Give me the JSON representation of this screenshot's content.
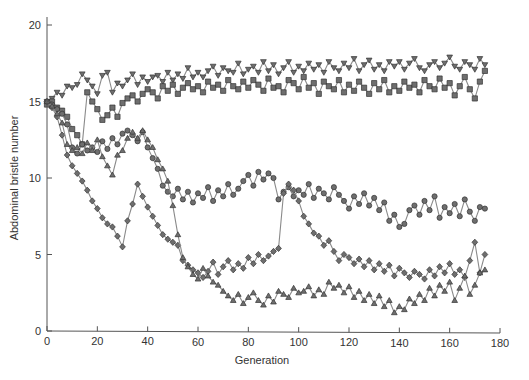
{
  "chart_data": {
    "type": "line",
    "title": "",
    "xlabel": "Generation",
    "ylabel": "Abdominal bristle number",
    "xlim": [
      0,
      180
    ],
    "ylim": [
      0,
      20
    ],
    "xticks": [
      0,
      20,
      40,
      60,
      80,
      100,
      120,
      140,
      160,
      180
    ],
    "yticks": [
      0,
      5,
      10,
      15,
      20
    ],
    "grid": false,
    "legend": null,
    "colors": {
      "line": "#8a8a8a",
      "marker_fill": "#6e6e6e",
      "marker_stroke": "#333333",
      "axis": "#555555"
    },
    "series": [
      {
        "name": "Upward line 1",
        "marker": "triangle-down",
        "x_start": 0,
        "x_step": 2,
        "values": [
          15.0,
          15.2,
          15.6,
          15.4,
          16.0,
          15.9,
          16.1,
          16.8,
          16.4,
          16.0,
          15.5,
          16.7,
          16.9,
          15.6,
          16.2,
          16.0,
          16.4,
          16.8,
          16.1,
          16.6,
          16.3,
          16.6,
          16.7,
          16.3,
          16.9,
          16.4,
          16.8,
          16.5,
          17.2,
          16.6,
          16.9,
          16.6,
          17.0,
          17.3,
          16.7,
          17.2,
          17.0,
          16.9,
          17.5,
          16.8,
          17.1,
          17.3,
          16.9,
          17.6,
          17.0,
          17.4,
          16.8,
          17.2,
          17.6,
          16.9,
          17.3,
          17.0,
          17.5,
          17.1,
          17.4,
          16.9,
          17.6,
          17.2,
          17.0,
          17.5,
          17.2,
          17.8,
          17.0,
          17.4,
          17.7,
          17.1,
          17.4,
          17.0,
          17.6,
          17.3,
          17.6,
          17.1,
          17.5,
          17.8,
          17.2,
          17.0,
          17.4,
          17.6,
          17.2,
          17.5,
          17.9,
          17.3,
          17.1,
          17.6,
          17.4,
          17.1,
          17.8,
          17.4
        ]
      },
      {
        "name": "Upward line 2",
        "marker": "square",
        "x_start": 0,
        "x_step": 2,
        "values": [
          14.8,
          15.0,
          14.6,
          14.4,
          14.0,
          13.2,
          12.8,
          12.2,
          15.6,
          15.0,
          14.5,
          13.8,
          14.1,
          14.6,
          14.0,
          14.9,
          15.2,
          15.4,
          15.0,
          15.5,
          15.8,
          15.6,
          15.2,
          16.0,
          15.7,
          16.1,
          15.5,
          15.9,
          16.2,
          15.8,
          16.0,
          15.6,
          16.3,
          15.9,
          16.1,
          15.7,
          16.4,
          16.0,
          15.8,
          16.3,
          15.9,
          16.4,
          16.1,
          15.7,
          16.5,
          15.9,
          16.0,
          15.6,
          16.4,
          16.2,
          15.8,
          16.6,
          15.9,
          16.2,
          15.5,
          16.3,
          16.0,
          15.8,
          16.4,
          15.6,
          16.1,
          15.7,
          16.3,
          15.9,
          15.5,
          16.2,
          15.8,
          16.4,
          15.6,
          16.0,
          15.7,
          16.3,
          15.9,
          16.1,
          15.6,
          16.4,
          16.0,
          15.8,
          16.5,
          15.9,
          16.2,
          15.4,
          16.0,
          16.6,
          15.8,
          15.2,
          16.3,
          17.0
        ]
      },
      {
        "name": "Downward line 1",
        "marker": "circle",
        "x_start": 0,
        "x_step": 2,
        "values": [
          15.0,
          14.8,
          14.5,
          14.2,
          13.5,
          12.0,
          11.6,
          12.2,
          11.8,
          12.0,
          11.7,
          12.4,
          11.9,
          12.6,
          12.2,
          12.9,
          13.1,
          12.8,
          12.4,
          13.0,
          12.0,
          11.3,
          10.6,
          9.5,
          9.1,
          8.8,
          9.3,
          8.6,
          9.1,
          8.4,
          9.0,
          8.7,
          9.4,
          8.5,
          9.2,
          8.8,
          9.6,
          8.9,
          9.3,
          9.8,
          10.2,
          9.5,
          10.4,
          9.9,
          10.3,
          10.0,
          8.6,
          9.1,
          9.4,
          8.8,
          9.2,
          8.9,
          9.6,
          8.7,
          9.3,
          9.0,
          8.6,
          9.4,
          8.9,
          8.5,
          8.0,
          8.8,
          8.3,
          9.0,
          8.2,
          8.7,
          7.9,
          8.4,
          7.2,
          7.6,
          6.8,
          7.0,
          7.9,
          8.2,
          7.6,
          8.5,
          7.9,
          8.8,
          7.4,
          8.1,
          7.7,
          8.3,
          7.5,
          8.6,
          7.8,
          7.2,
          8.1,
          8.0
        ]
      },
      {
        "name": "Downward line 2",
        "marker": "diamond",
        "x_start": 0,
        "x_step": 2,
        "values": [
          15.0,
          14.6,
          14.0,
          12.8,
          11.5,
          10.8,
          10.3,
          9.8,
          9.2,
          8.5,
          8.0,
          7.4,
          7.0,
          6.8,
          6.2,
          5.5,
          7.2,
          8.3,
          9.6,
          8.8,
          8.1,
          7.5,
          6.9,
          6.3,
          6.0,
          5.8,
          5.6,
          4.6,
          4.3,
          4.0,
          3.8,
          3.5,
          3.9,
          4.5,
          3.7,
          4.2,
          4.6,
          4.0,
          4.4,
          4.1,
          4.8,
          4.4,
          5.0,
          4.6,
          4.9,
          5.2,
          5.4,
          9.0,
          9.6,
          9.2,
          8.5,
          7.5,
          7.0,
          6.4,
          6.2,
          5.6,
          5.9,
          5.2,
          4.6,
          5.0,
          4.8,
          4.4,
          4.7,
          4.2,
          4.6,
          4.0,
          4.4,
          3.9,
          4.3,
          3.6,
          4.1,
          3.8,
          3.5,
          3.9,
          3.7,
          3.4,
          4.0,
          3.6,
          4.2,
          3.8,
          4.4,
          3.7,
          4.0,
          3.5,
          4.6,
          5.8,
          3.8,
          5.0
        ]
      },
      {
        "name": "Downward line 3",
        "marker": "triangle-up",
        "x_start": 0,
        "x_step": 2,
        "values": [
          15.0,
          14.7,
          14.2,
          13.6,
          12.2,
          11.8,
          12.0,
          11.6,
          12.3,
          11.8,
          12.5,
          11.4,
          10.8,
          10.2,
          11.5,
          11.8,
          12.6,
          13.0,
          12.6,
          13.1,
          12.5,
          12.0,
          11.2,
          10.6,
          9.8,
          8.2,
          6.3,
          4.8,
          4.2,
          3.7,
          3.4,
          4.1,
          3.6,
          3.2,
          3.0,
          2.6,
          2.3,
          2.0,
          2.4,
          1.8,
          2.2,
          2.5,
          2.0,
          1.7,
          2.3,
          1.9,
          2.6,
          2.4,
          2.2,
          2.8,
          2.5,
          2.6,
          2.9,
          2.3,
          2.7,
          2.4,
          3.2,
          2.8,
          3.0,
          2.5,
          2.9,
          2.2,
          2.6,
          2.0,
          2.4,
          1.8,
          2.3,
          1.6,
          2.0,
          1.2,
          1.6,
          1.4,
          2.1,
          1.8,
          2.4,
          2.0,
          2.8,
          2.3,
          3.0,
          2.6,
          3.2,
          2.0,
          2.8,
          3.6,
          2.4,
          3.0,
          3.8,
          4.0
        ]
      }
    ]
  },
  "axes": {
    "x_title": "Generation",
    "y_title": "Abdominal bristle number",
    "x_tick_labels": [
      "0",
      "20",
      "40",
      "60",
      "80",
      "100",
      "120",
      "140",
      "160",
      "180"
    ],
    "y_tick_labels": [
      "0",
      "5",
      "10",
      "15",
      "20"
    ]
  }
}
